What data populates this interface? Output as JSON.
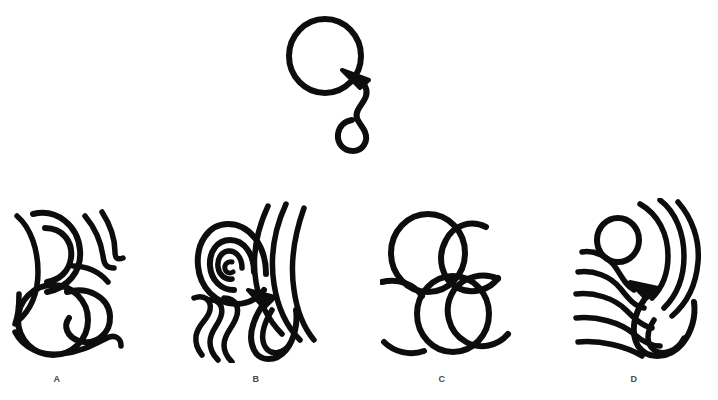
{
  "page": {
    "type": "visual-analogy-multiple-choice",
    "background_color": "#ffffff",
    "ink_color": "#0d0d0d",
    "label_color": "#4a4a4a",
    "width": 718,
    "height": 400
  },
  "prompt": {
    "name": "prompt-figure",
    "description": "Large circle with an arrowhead pointing up-left into its lower-right edge, attached to a wavy S-shaped tail ending in a hook curve",
    "elements": [
      "large-circle",
      "arrowhead",
      "s-curve-tail",
      "hook-end"
    ],
    "center_x": 324,
    "center_y": 55,
    "circle_radius": 36
  },
  "options": [
    {
      "id": "A",
      "label": "A",
      "name": "option-a",
      "label_x": 57,
      "label_y": 380,
      "description": "Two overlapping circles at lower left with nested crescent arcs and short hook strokes above and to the right; no arrowhead",
      "has_arrowhead": false,
      "shapes": [
        "circle",
        "circle",
        "nested-arcs",
        "hook-strokes"
      ]
    },
    {
      "id": "B",
      "label": "B",
      "name": "option-b",
      "label_x": 256,
      "label_y": 380,
      "description": "Concentric spiral rings around a small center, an arrowhead at lower right of the rings, wavy vertical squiggles below left and long sweeping arcs to the right",
      "has_arrowhead": true,
      "shapes": [
        "concentric-spiral",
        "arrowhead",
        "wavy-lines",
        "long-arcs"
      ]
    },
    {
      "id": "C",
      "label": "C",
      "name": "option-c",
      "label_x": 442,
      "label_y": 380,
      "description": "Four circular forms: full circle upper left, open arc upper right, full circle lower middle, open arc lower left; no arrowhead",
      "has_arrowhead": false,
      "shapes": [
        "circle",
        "open-arc",
        "circle",
        "open-arc"
      ]
    },
    {
      "id": "D",
      "label": "D",
      "name": "option-d",
      "label_x": 634,
      "label_y": 380,
      "description": "Small circle top-left surrounded by a fan of concentric radiating arcs, an arrowhead at mid right, and a teardrop loop at lower right",
      "has_arrowhead": true,
      "shapes": [
        "small-circle",
        "concentric-arcs",
        "arrowhead",
        "teardrop-loop"
      ]
    }
  ]
}
